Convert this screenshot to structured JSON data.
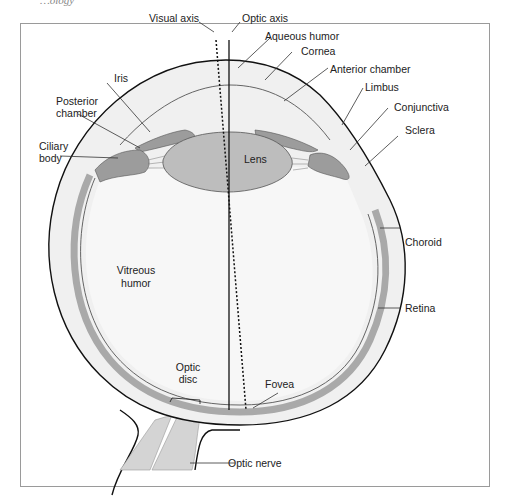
{
  "header_fragment": "…ology",
  "figure": {
    "labels": {
      "visual_axis": "Visual axis",
      "optic_axis": "Optic axis",
      "aqueous_humor": "Aqueous humor",
      "cornea": "Cornea",
      "anterior_chamber": "Anterior chamber",
      "limbus": "Limbus",
      "conjunctiva": "Conjunctiva",
      "sclera": "Sclera",
      "iris": "Iris",
      "posterior_chamber_1": "Posterior",
      "posterior_chamber_2": "chamber",
      "ciliary_body_1": "Ciliary",
      "ciliary_body_2": "body",
      "lens": "Lens",
      "vitreous_humor_1": "Vitreous",
      "vitreous_humor_2": "humor",
      "choroid": "Choroid",
      "retina": "Retina",
      "optic_disc_1": "Optic",
      "optic_disc_2": "disc",
      "fovea": "Fovea",
      "optic_nerve": "Optic nerve"
    },
    "colors": {
      "frame": "#9a9a9a",
      "outline": "#111111",
      "sclera_fill": "#f0f0f0",
      "choroid_fill": "#a9a9a9",
      "tissue_fill": "#9c9c9c",
      "lens_fill": "#bdbdbd",
      "nerve_fill": "#d4d4d4",
      "interior_fill": "#f7f7f7"
    }
  }
}
